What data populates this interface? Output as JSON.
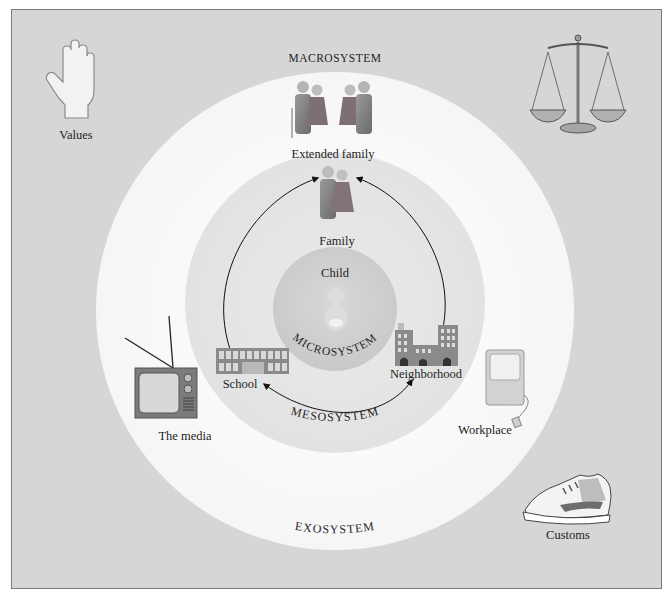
{
  "diagram": {
    "systems": {
      "macrosystem": "MACROSYSTEM",
      "exosystem": "EXOSYSTEM",
      "mesosystem": "MESOSYSTEM",
      "microsystem": "MICROSYSTEM"
    },
    "center": {
      "label": "Child",
      "icon": "baby-icon"
    },
    "microsystem_items": [
      {
        "label": "Family",
        "icon": "family-icon"
      },
      {
        "label": "School",
        "icon": "school-building-icon"
      },
      {
        "label": "Neighborhood",
        "icon": "city-buildings-icon"
      }
    ],
    "exosystem_items": [
      {
        "label": "Extended family",
        "icon": "extended-family-icon"
      },
      {
        "label": "The media",
        "icon": "television-icon"
      },
      {
        "label": "Workplace",
        "icon": "computer-icon"
      }
    ],
    "macrosystem_items": [
      {
        "label": "Values",
        "icon": "hand-icon"
      },
      {
        "label": "Customs",
        "icon": "sneaker-icon"
      },
      {
        "label": "Laws",
        "icon": "scales-of-justice-icon",
        "shown_label": false
      }
    ],
    "colors": {
      "macro_bg": "#d6d6d6",
      "exo_ring": "#f7f7f7",
      "meso_ring": "#e6e6e6",
      "micro_core": "#cfcfcf",
      "figure": "#7d7d7d"
    }
  }
}
